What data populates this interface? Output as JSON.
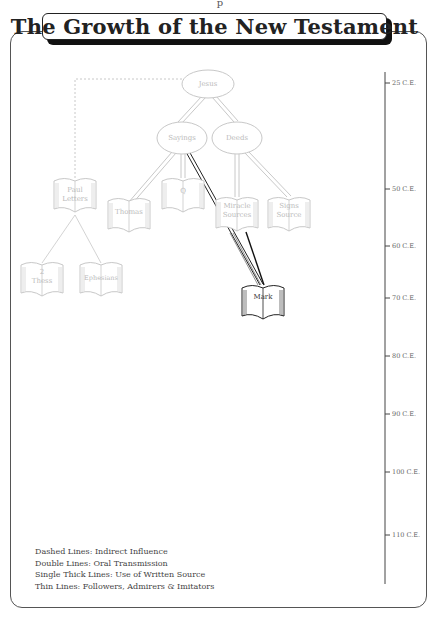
{
  "header": {
    "top_fragment": "p",
    "title": "The Growth of the New Testament"
  },
  "nodes": {
    "jesus": "Jesus",
    "sayings": "Sayings",
    "deeds": "Deeds",
    "paul_letters_1": "Paul",
    "paul_letters_2": "Letters",
    "thomas": "Thomas",
    "q": "Q",
    "miracle_1": "Miracle",
    "miracle_2": "Sources",
    "signs_1": "Signs",
    "signs_2": "Source",
    "thess_1": "2",
    "thess_2": "Thess",
    "ephesians": "Ephesians",
    "mark": "Mark"
  },
  "timeline": {
    "ticks": [
      {
        "label": "25 C.E.",
        "y": 83
      },
      {
        "label": "50 C.E.",
        "y": 189
      },
      {
        "label": "60 C.E.",
        "y": 246
      },
      {
        "label": "70 C.E.",
        "y": 298
      },
      {
        "label": "80 C.E.",
        "y": 356
      },
      {
        "label": "90 C.E.",
        "y": 414
      },
      {
        "label": "100 C.E.",
        "y": 472
      },
      {
        "label": "110 C.E.",
        "y": 535
      }
    ]
  },
  "legend": {
    "dashed": "Dashed Lines: Indirect Influence",
    "double": "Double Lines: Oral Transmission",
    "thick": "Single Thick Lines: Use of Written Source",
    "thin": "Thin Lines: Followers, Admirers & Imitators"
  },
  "colors": {
    "faded": "#c8c8c8",
    "frame": "#555555",
    "dark": "#222222"
  }
}
